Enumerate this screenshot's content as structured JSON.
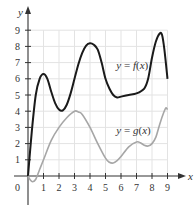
{
  "chart_data": {
    "type": "line",
    "title": "",
    "xlabel": "x",
    "ylabel": "y",
    "xlim": [
      0,
      9
    ],
    "ylim": [
      0,
      9
    ],
    "grid": true,
    "x_ticks": [
      "1",
      "2",
      "3",
      "4",
      "5",
      "6",
      "7",
      "8",
      "9"
    ],
    "y_ticks": [
      "1",
      "2",
      "3",
      "4",
      "5",
      "6",
      "7",
      "8",
      "9"
    ],
    "origin_label": "0",
    "series": [
      {
        "name": "y = f(x)",
        "color": "#1a1a1a",
        "label_pos": [
          5.7,
          6.6
        ],
        "points": [
          [
            0,
            0
          ],
          [
            0.25,
            2.8
          ],
          [
            0.5,
            5
          ],
          [
            0.75,
            6.0
          ],
          [
            1,
            6.3
          ],
          [
            1.25,
            6.0
          ],
          [
            1.5,
            5.2
          ],
          [
            1.75,
            4.5
          ],
          [
            2,
            4.1
          ],
          [
            2.25,
            4.05
          ],
          [
            2.5,
            4.4
          ],
          [
            2.75,
            5.1
          ],
          [
            3,
            6
          ],
          [
            3.25,
            6.9
          ],
          [
            3.5,
            7.6
          ],
          [
            3.75,
            8.05
          ],
          [
            4,
            8.2
          ],
          [
            4.25,
            8.1
          ],
          [
            4.5,
            7.8
          ],
          [
            4.75,
            7.0
          ],
          [
            5,
            6
          ],
          [
            5.25,
            5.4
          ],
          [
            5.5,
            5.0
          ],
          [
            5.75,
            4.85
          ],
          [
            6,
            4.9
          ],
          [
            6.5,
            5.0
          ],
          [
            7,
            5.1
          ],
          [
            7.5,
            5.4
          ],
          [
            7.75,
            6.0
          ],
          [
            8,
            7.3
          ],
          [
            8.25,
            8.3
          ],
          [
            8.5,
            8.8
          ],
          [
            8.65,
            8.7
          ],
          [
            8.8,
            7.8
          ],
          [
            9,
            6
          ]
        ]
      },
      {
        "name": "y = g(x)",
        "color": "#a6a6a6",
        "label_pos": [
          5.7,
          2.6
        ],
        "points": [
          [
            0,
            0
          ],
          [
            0.15,
            -0.25
          ],
          [
            0.3,
            -0.35
          ],
          [
            0.5,
            -0.2
          ],
          [
            0.75,
            0.4
          ],
          [
            1,
            1
          ],
          [
            1.5,
            2.2
          ],
          [
            2,
            3
          ],
          [
            2.5,
            3.6
          ],
          [
            3,
            4
          ],
          [
            3.25,
            3.95
          ],
          [
            3.5,
            3.8
          ],
          [
            4,
            3
          ],
          [
            4.5,
            2
          ],
          [
            5,
            1.1
          ],
          [
            5.25,
            0.85
          ],
          [
            5.5,
            0.8
          ],
          [
            5.75,
            0.95
          ],
          [
            6,
            1.2
          ],
          [
            6.5,
            1.8
          ],
          [
            7,
            2.1
          ],
          [
            7.25,
            2.05
          ],
          [
            7.5,
            1.9
          ],
          [
            7.75,
            1.85
          ],
          [
            8,
            2
          ],
          [
            8.25,
            2.4
          ],
          [
            8.5,
            3.2
          ],
          [
            8.75,
            3.9
          ],
          [
            8.9,
            4.2
          ],
          [
            9,
            4.1
          ]
        ]
      }
    ]
  }
}
